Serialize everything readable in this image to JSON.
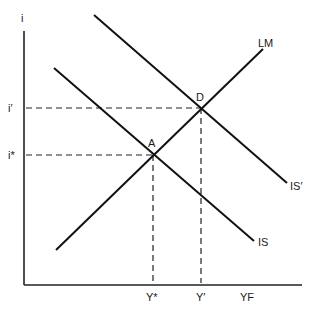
{
  "diagram": {
    "type": "IS-LM",
    "axes": {
      "y_label": "i",
      "x_labels": {
        "y_star": "Y*",
        "y_prime": "Y′",
        "yf": "YF"
      },
      "y_ticks": {
        "i_prime": "i′",
        "i_star": "i*"
      }
    },
    "curves": [
      {
        "id": "LM",
        "label": "LM",
        "slope": "upward"
      },
      {
        "id": "IS",
        "label": "IS",
        "slope": "downward"
      },
      {
        "id": "IS_prime",
        "label": "IS′",
        "slope": "downward"
      }
    ],
    "points": [
      {
        "id": "A",
        "label": "A",
        "intersection": [
          "IS",
          "LM"
        ],
        "x_label": "Y*",
        "y_label": "i*"
      },
      {
        "id": "D",
        "label": "D",
        "intersection": [
          "IS′",
          "LM"
        ],
        "x_label": "Y′",
        "y_label": "i′"
      }
    ]
  }
}
